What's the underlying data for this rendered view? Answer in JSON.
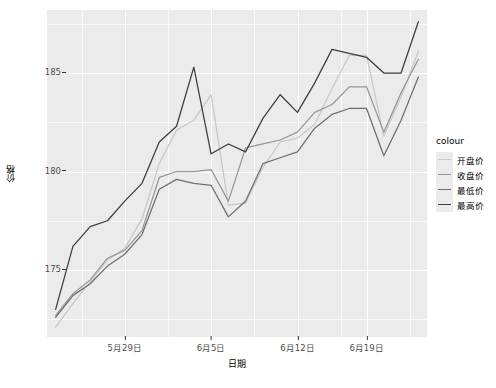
{
  "chart_data": {
    "type": "line",
    "title": "",
    "xlabel": "日期",
    "ylabel": "价格",
    "grid": true,
    "legend_position": "right",
    "legend_title": "colour",
    "ylim": [
      171.6,
      188.2
    ],
    "yticks": [
      175,
      180,
      185
    ],
    "ytick_labels": [
      "175",
      "180",
      "185"
    ],
    "xticks": [
      "5月29日",
      "6月5日",
      "6月12日",
      "6月19日"
    ],
    "xtick_index": [
      4,
      9,
      14,
      18
    ],
    "x": [
      "5月25日",
      "5月26日",
      "5月27日",
      "5月28日",
      "5月29日",
      "5月30日",
      "6月1日",
      "6月2日",
      "6月3日",
      "6月5日",
      "6月6日",
      "6月8日",
      "6月9日",
      "6月10日",
      "6月12日",
      "6月15日",
      "6月16日",
      "6月17日",
      "6月19日",
      "6月22日",
      "6月23日",
      "6月24日"
    ],
    "series": [
      {
        "name": "开盘价",
        "colour": "#C8C8C8",
        "values": [
          172.1,
          173.3,
          174.4,
          175.5,
          176.1,
          177.6,
          180.4,
          182.1,
          182.6,
          183.9,
          178.3,
          178.4,
          180.2,
          181.5,
          181.7,
          182.4,
          184.2,
          185.9,
          185.9,
          181.8,
          183.8,
          186.1
        ]
      },
      {
        "name": "收盘价",
        "colour": "#969696",
        "values": [
          172.7,
          173.8,
          174.5,
          175.6,
          176.0,
          177.0,
          179.7,
          180.0,
          180.0,
          180.1,
          178.5,
          181.2,
          181.4,
          181.6,
          182.0,
          183.0,
          183.4,
          184.3,
          184.3,
          182.0,
          184.0,
          185.7
        ]
      },
      {
        "name": "最低价",
        "colour": "#6E6E6E",
        "values": [
          172.6,
          173.7,
          174.3,
          175.2,
          175.8,
          176.8,
          179.1,
          179.6,
          179.4,
          179.3,
          177.7,
          178.5,
          180.4,
          180.7,
          181.0,
          182.2,
          182.9,
          183.2,
          183.2,
          180.8,
          182.6,
          184.8
        ]
      },
      {
        "name": "最高价",
        "colour": "#3C3C3C",
        "values": [
          173.0,
          176.2,
          177.2,
          177.5,
          178.5,
          179.4,
          181.5,
          182.3,
          185.3,
          180.9,
          181.4,
          181.0,
          182.7,
          183.9,
          183.0,
          184.5,
          186.2,
          186.0,
          185.8,
          185.0,
          185.0,
          187.6
        ]
      }
    ]
  }
}
